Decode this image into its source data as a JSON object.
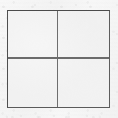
{
  "figure": {
    "kind": "four-pane-grid",
    "canvas": {
      "width": 118,
      "height": 118,
      "background_color": "#f3f3f3",
      "texture": "scanned-paper-grain"
    },
    "square": {
      "left": 7,
      "top": 10,
      "width": 103,
      "height": 98,
      "fill_color": "#f1f1f1",
      "border_width": 1.4,
      "border_color_top": "#4b4b4b",
      "border_color_left": "#4f4f4f",
      "border_color_right": "#5d5d5d",
      "border_color_bottom": "#5a5a5a"
    },
    "dividers": [
      {
        "name": "vertical-divider",
        "orientation": "vertical",
        "position_percent": 48.2,
        "thickness": 1.3,
        "color": "#6e6e6e"
      },
      {
        "name": "horizontal-divider",
        "orientation": "horizontal",
        "position_percent": 48.3,
        "thickness": 1.3,
        "color": "#6b6b6b"
      }
    ],
    "quadrants": [
      {
        "id": "top-left",
        "label": "",
        "fill_color": "#f1f1f1"
      },
      {
        "id": "top-right",
        "label": "",
        "fill_color": "#f1f1f1"
      },
      {
        "id": "bottom-left",
        "label": "",
        "fill_color": "#f1f1f1"
      },
      {
        "id": "bottom-right",
        "label": "",
        "fill_color": "#f1f1f1"
      }
    ]
  }
}
